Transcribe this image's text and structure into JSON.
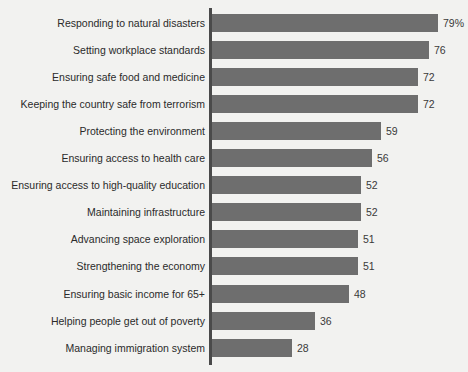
{
  "chart_data": {
    "type": "bar",
    "orientation": "horizontal",
    "title": "",
    "subtitle": "",
    "xlabel": "",
    "ylabel": "",
    "xlim": [
      0,
      79
    ],
    "grid": false,
    "legend": null,
    "bar_color": "#6e6e6e",
    "background_color": "#f2f2f0",
    "axis_color": "#4a4a4a",
    "label_color": "#2a2a2a",
    "value_color": "#3a3a3a",
    "categories": [
      "Responding to natural disasters",
      "Setting workplace standards",
      "Ensuring safe food and medicine",
      "Keeping the country safe from terrorism",
      "Protecting the environment",
      "Ensuring access to health care",
      "Ensuring access to high-quality education",
      "Maintaining infrastructure",
      "Advancing space exploration",
      "Strengthening the economy",
      "Ensuring basic income for 65+",
      "Helping people get out of poverty",
      "Managing immigration system"
    ],
    "values": [
      79,
      76,
      72,
      72,
      59,
      56,
      52,
      52,
      51,
      51,
      48,
      36,
      28
    ],
    "value_labels": [
      "79%",
      "76",
      "72",
      "72",
      "59",
      "56",
      "52",
      "52",
      "51",
      "51",
      "48",
      "36",
      "28"
    ]
  }
}
